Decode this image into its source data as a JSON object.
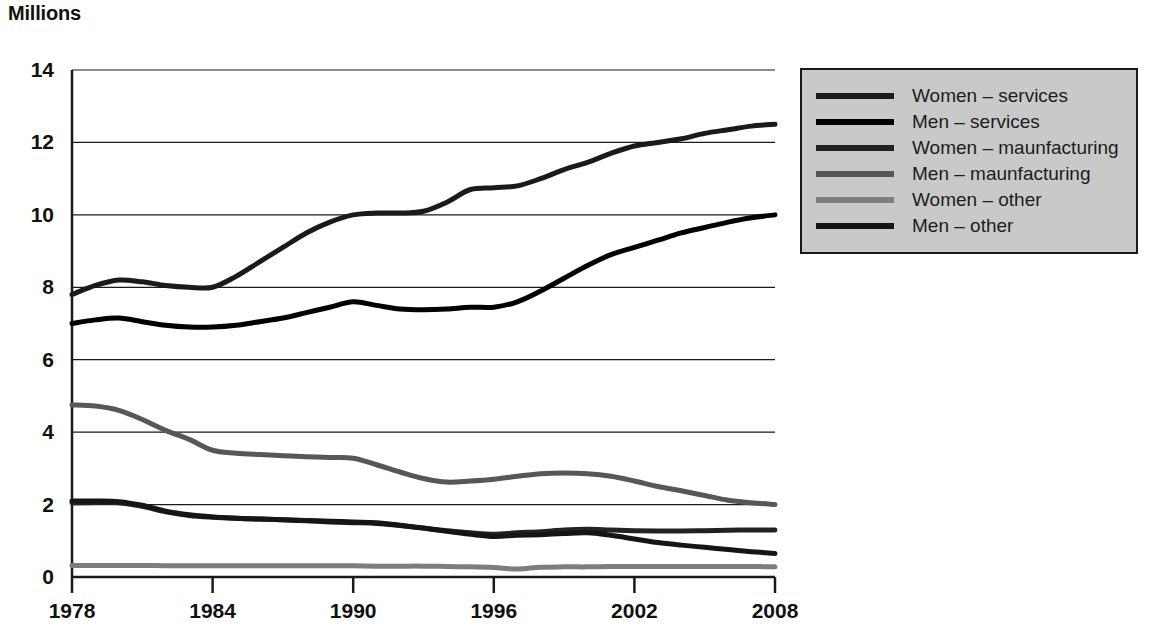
{
  "title": "Millions",
  "axis": {
    "y_ticks": [
      "0",
      "2",
      "4",
      "6",
      "8",
      "10",
      "12",
      "14"
    ],
    "x_ticks": [
      "1978",
      "1984",
      "1990",
      "1996",
      "2002",
      "2008"
    ]
  },
  "legend": {
    "items": [
      {
        "label": "Women – services",
        "color": "#1a1a1a"
      },
      {
        "label": "Men – services",
        "color": "#000000"
      },
      {
        "label": "Women – maunfacturing",
        "color": "#222222"
      },
      {
        "label": "Men – maunfacturing",
        "color": "#575757"
      },
      {
        "label": "Women – other",
        "color": "#7d7d7d"
      },
      {
        "label": "Men – other",
        "color": "#151515"
      }
    ]
  },
  "chart_data": {
    "type": "line",
    "title": "Millions",
    "xlabel": "",
    "ylabel": "Millions",
    "xlim": [
      1978,
      2008
    ],
    "ylim": [
      0,
      14
    ],
    "ytick_values": [
      0,
      2,
      4,
      6,
      8,
      10,
      12,
      14
    ],
    "xtick_values": [
      1978,
      1984,
      1990,
      1996,
      2002,
      2008
    ],
    "grid": "horizontal",
    "legend_position": "top-right-outside",
    "x": [
      1978,
      1979,
      1980,
      1981,
      1982,
      1983,
      1984,
      1985,
      1986,
      1987,
      1988,
      1989,
      1990,
      1991,
      1992,
      1993,
      1994,
      1995,
      1996,
      1997,
      1998,
      1999,
      2000,
      2001,
      2002,
      2003,
      2004,
      2005,
      2006,
      2007,
      2008
    ],
    "series": [
      {
        "name": "Women – services",
        "color": "#1a1a1a",
        "values": [
          7.8,
          8.05,
          8.2,
          8.15,
          8.05,
          8.0,
          8.0,
          8.3,
          8.7,
          9.1,
          9.5,
          9.8,
          10.0,
          10.05,
          10.05,
          10.1,
          10.35,
          10.7,
          10.75,
          10.8,
          11.0,
          11.25,
          11.45,
          11.7,
          11.9,
          12.0,
          12.1,
          12.25,
          12.35,
          12.45,
          12.5
        ]
      },
      {
        "name": "Men – services",
        "color": "#000000",
        "values": [
          7.0,
          7.1,
          7.15,
          7.05,
          6.95,
          6.9,
          6.9,
          6.95,
          7.05,
          7.15,
          7.3,
          7.45,
          7.6,
          7.5,
          7.4,
          7.38,
          7.4,
          7.45,
          7.45,
          7.6,
          7.9,
          8.25,
          8.6,
          8.9,
          9.1,
          9.3,
          9.5,
          9.65,
          9.8,
          9.92,
          10.0
        ]
      },
      {
        "name": "Women – maunfacturing",
        "color": "#222222",
        "values": [
          2.05,
          2.06,
          2.05,
          1.95,
          1.8,
          1.7,
          1.65,
          1.62,
          1.6,
          1.58,
          1.55,
          1.52,
          1.5,
          1.48,
          1.42,
          1.35,
          1.28,
          1.22,
          1.18,
          1.22,
          1.25,
          1.3,
          1.32,
          1.3,
          1.28,
          1.27,
          1.27,
          1.28,
          1.29,
          1.3,
          1.3
        ]
      },
      {
        "name": "Men – maunfacturing",
        "color": "#575757",
        "values": [
          4.75,
          4.72,
          4.6,
          4.35,
          4.05,
          3.8,
          3.5,
          3.42,
          3.38,
          3.35,
          3.32,
          3.3,
          3.28,
          3.1,
          2.9,
          2.72,
          2.62,
          2.65,
          2.7,
          2.78,
          2.85,
          2.87,
          2.85,
          2.78,
          2.65,
          2.5,
          2.38,
          2.25,
          2.12,
          2.05,
          2.0
        ]
      },
      {
        "name": "Women – other",
        "color": "#7d7d7d",
        "values": [
          0.32,
          0.32,
          0.32,
          0.32,
          0.31,
          0.31,
          0.31,
          0.31,
          0.31,
          0.31,
          0.31,
          0.31,
          0.31,
          0.3,
          0.3,
          0.3,
          0.29,
          0.28,
          0.26,
          0.22,
          0.27,
          0.28,
          0.28,
          0.29,
          0.29,
          0.29,
          0.29,
          0.29,
          0.29,
          0.29,
          0.28
        ]
      },
      {
        "name": "Men – other",
        "color": "#151515",
        "values": [
          2.1,
          2.1,
          2.08,
          1.98,
          1.82,
          1.72,
          1.66,
          1.62,
          1.6,
          1.58,
          1.56,
          1.54,
          1.52,
          1.5,
          1.43,
          1.35,
          1.26,
          1.18,
          1.12,
          1.15,
          1.17,
          1.2,
          1.22,
          1.15,
          1.05,
          0.95,
          0.88,
          0.82,
          0.76,
          0.7,
          0.65
        ]
      }
    ]
  }
}
